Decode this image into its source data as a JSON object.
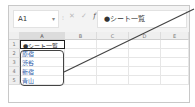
{
  "formula_bar": {
    "name_box": "A1",
    "dropdown_icon": "▾",
    "separator": "⁝",
    "cancel_icon": "✕",
    "confirm_icon": "✓",
    "fx_label": "fx",
    "formula": "●シート一覧"
  },
  "columns": [
    "A",
    "B",
    "C",
    "D",
    "E"
  ],
  "rows": [
    {
      "num": "1",
      "A": "●シート一覧",
      "link": false
    },
    {
      "num": "2",
      "A": "原宿",
      "link": true
    },
    {
      "num": "3",
      "A": "渋谷",
      "link": true
    },
    {
      "num": "4",
      "A": "新宿",
      "link": true
    },
    {
      "num": "5",
      "A": "青山",
      "link": true
    }
  ],
  "annotation": {
    "highlight_range": "A2:A5",
    "callout_color": "#444444"
  }
}
